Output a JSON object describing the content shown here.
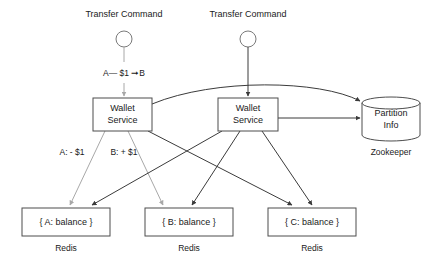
{
  "diagram": {
    "commands": [
      {
        "id": "cmd-left",
        "label": "Transfer Command",
        "x": 124,
        "y": 14,
        "node_x": 124,
        "node_y": 39,
        "node_r": 8
      },
      {
        "id": "cmd-right",
        "label": "Transfer Command",
        "x": 248,
        "y": 14,
        "node_x": 248,
        "node_y": 39,
        "node_r": 8
      }
    ],
    "services": [
      {
        "id": "wallet-1",
        "line1": "Wallet",
        "line2": "Service",
        "x": 93,
        "y": 98,
        "w": 59,
        "h": 33
      },
      {
        "id": "wallet-2",
        "line1": "Wallet",
        "line2": "Service",
        "x": 218,
        "y": 98,
        "w": 60,
        "h": 33
      }
    ],
    "store": {
      "id": "partition-info",
      "line1": "Partition",
      "line2": "Info",
      "caption": "Zookeeper",
      "x": 362,
      "y": 97,
      "w": 58,
      "h": 44,
      "ellipse_ry": 6
    },
    "redis_nodes": [
      {
        "id": "redis-a",
        "label": "{ A: balance }",
        "caption": "Redis",
        "x": 22,
        "y": 208,
        "w": 88,
        "h": 28
      },
      {
        "id": "redis-b",
        "label": "{ B: balance }",
        "caption": "Redis",
        "x": 145,
        "y": 208,
        "w": 88,
        "h": 28
      },
      {
        "id": "redis-c",
        "label": "{ C: balance }",
        "caption": "Redis",
        "x": 268,
        "y": 208,
        "w": 88,
        "h": 28
      }
    ],
    "edge_labels": [
      {
        "id": "transfer-expr",
        "text": "A— $1 ➞B",
        "x": 124,
        "y": 73
      },
      {
        "id": "debit-label",
        "text": "A: - $1",
        "x": 72,
        "y": 152
      },
      {
        "id": "credit-label",
        "text": "B: + $1",
        "x": 124,
        "y": 152
      }
    ],
    "colors": {
      "stroke_dark": "#3b3b3b",
      "stroke_gray": "#a8a8a8",
      "box_border": "#4d4d4d",
      "text": "#1a1a1a",
      "background": "#ffffff"
    }
  }
}
